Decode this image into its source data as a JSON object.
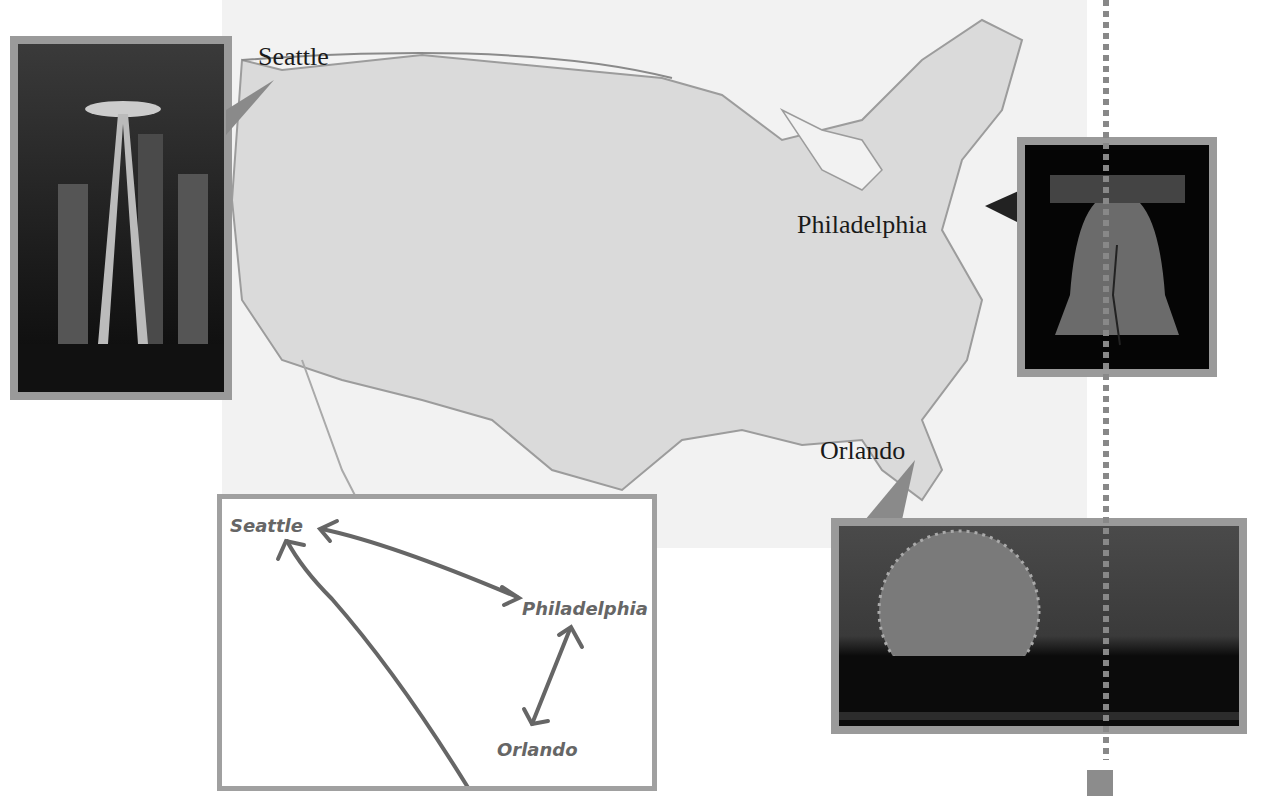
{
  "map": {
    "title": "United States map",
    "colors": {
      "land": "#dcdcdc",
      "water": "#f0f0f0",
      "border": "#8a8a8a",
      "frame": "#9a9a9a"
    }
  },
  "cities": [
    {
      "name": "Seattle",
      "photo": "Space Needle at night"
    },
    {
      "name": "Philadelphia",
      "photo": "Liberty Bell"
    },
    {
      "name": "Orlando",
      "photo": "Epcot Spaceship Earth at night"
    }
  ],
  "diagram": {
    "nodes": [
      "Seattle",
      "Philadelphia",
      "Orlando"
    ],
    "edges": [
      {
        "from": "Seattle",
        "to": "Philadelphia",
        "bidirectional": true
      },
      {
        "from": "Philadelphia",
        "to": "Orlando",
        "bidirectional": true
      },
      {
        "from": "Orlando",
        "to": "Seattle",
        "bidirectional": false
      }
    ]
  }
}
